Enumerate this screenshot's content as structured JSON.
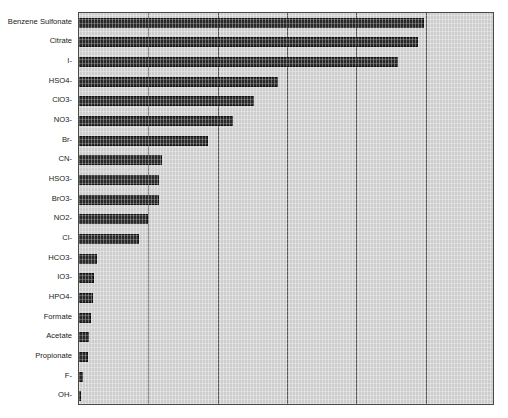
{
  "chart_data": {
    "type": "bar",
    "orientation": "horizontal",
    "title": "",
    "subtitle": "",
    "xlabel": "",
    "ylabel": "",
    "categories": [
      "Benzene Sulfonate",
      "Citrate",
      "I-",
      "HSO4-",
      "ClO3-",
      "NO3-",
      "Br-",
      "CN-",
      "HSO3-",
      "BrO3-",
      "NO2-",
      "Cl-",
      "HCO3-",
      "IO3-",
      "HPO4-",
      "Formate",
      "Acetate",
      "Propionate",
      "F-",
      "OH-"
    ],
    "values": [
      4.98,
      4.89,
      4.6,
      2.87,
      2.52,
      2.22,
      1.86,
      1.2,
      1.15,
      1.15,
      1.0,
      0.87,
      0.26,
      0.22,
      0.2,
      0.17,
      0.14,
      0.13,
      0.06,
      0.03
    ],
    "xlim": [
      0,
      6
    ],
    "xticks": [
      0,
      1,
      2,
      3,
      4,
      5,
      6
    ],
    "xticklabels": [
      "",
      "",
      "",
      "",
      "",
      "",
      ""
    ],
    "grid": true,
    "grid_axis": "x",
    "legend": false,
    "legend_position": "none",
    "bar_color": "#2a2a2a",
    "plot_background": "#d6d6d6",
    "axis_color": "#4a4a4a",
    "gridline_color": "#5a5a5a"
  },
  "figure": {
    "background": "#ffffff",
    "width": 508,
    "height": 418
  }
}
